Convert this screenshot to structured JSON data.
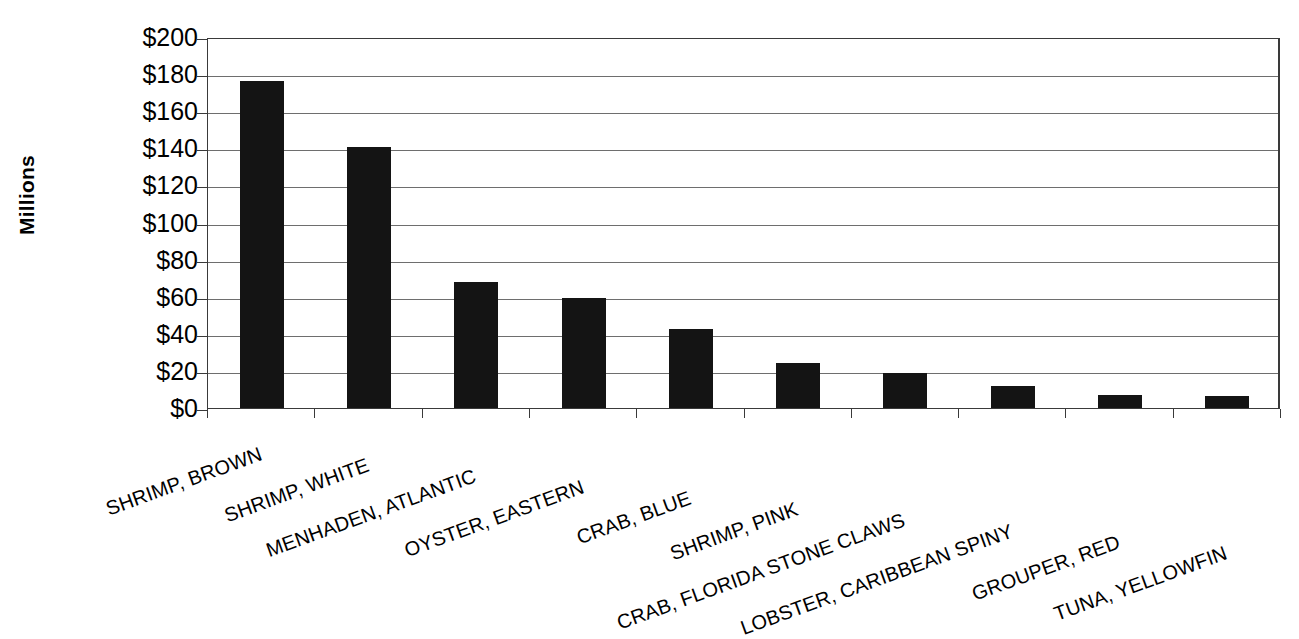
{
  "chart_data": {
    "type": "bar",
    "title": "",
    "subtitle": "",
    "xlabel": "",
    "ylabel": "Millions",
    "ylim": [
      0,
      200
    ],
    "ytick_step": 20,
    "ytick_labels": [
      "$200",
      "$180",
      "$160",
      "$140",
      "$120",
      "$100",
      "$80",
      "$60",
      "$40",
      "$20",
      "$0"
    ],
    "ytick_values": [
      200,
      180,
      160,
      140,
      120,
      100,
      80,
      60,
      40,
      20,
      0
    ],
    "grid": true,
    "legend": "none",
    "value_prefix": "$",
    "value_unit": "Millions",
    "bar_color": "#141414",
    "axis_color": "#3a3a3a",
    "grid_color": "#6e6e6e",
    "categories": [
      "SHRIMP, BROWN",
      "SHRIMP, WHITE",
      "MENHADEN, ATLANTIC",
      "OYSTER, EASTERN",
      "CRAB, BLUE",
      "SHRIMP, PINK",
      "CRAB, FLORIDA STONE CLAWS",
      "LOBSTER, CARIBBEAN SPINY",
      "GROUPER, RED",
      "TUNA, YELLOWFIN"
    ],
    "values": [
      176.5,
      140.5,
      68,
      59.5,
      42.5,
      24,
      19,
      12,
      7,
      6.5
    ],
    "series": [
      {
        "name": "Value",
        "values": [
          176.5,
          140.5,
          68,
          59.5,
          42.5,
          24,
          19,
          12,
          7,
          6.5
        ]
      }
    ]
  }
}
